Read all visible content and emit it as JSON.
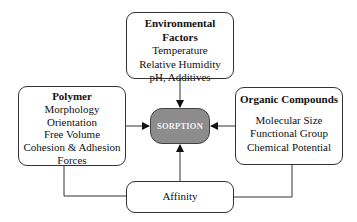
{
  "diagram": {
    "center": {
      "label": "SORPTION",
      "fill": "#8c8c8c"
    },
    "environmental": {
      "title": "Environmental Factors",
      "items": [
        "Temperature",
        "Relative Humidity",
        "pH, Additives"
      ]
    },
    "polymer": {
      "title": "Polymer",
      "items": [
        "Morphology",
        "Orientation",
        "Free Volume",
        "Cohesion & Adhesion",
        "Forces"
      ]
    },
    "organic": {
      "title": "Organic Compounds",
      "items": [
        "Molecular Size",
        "Functional Group",
        "Chemical Potential"
      ]
    },
    "affinity": {
      "label": "Affinity"
    }
  }
}
